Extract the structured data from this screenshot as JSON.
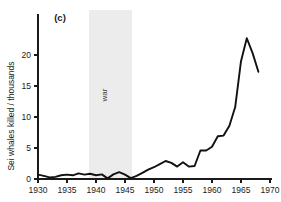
{
  "figure": {
    "panel_label": "(c)",
    "background_color": "#ffffff",
    "line_color": "#111111",
    "band_color": "#ececed"
  },
  "chart_data": {
    "type": "line",
    "title": "",
    "subtitle": "",
    "panel": "(c)",
    "xlabel": "",
    "ylabel": "Sei whales killed / thousands",
    "xlim": [
      1930,
      1970
    ],
    "ylim": [
      0,
      24
    ],
    "xticks": [
      1930,
      1935,
      1940,
      1945,
      1950,
      1955,
      1960,
      1965,
      1970
    ],
    "xtick_labels": [
      "1930",
      "1935",
      "1940",
      "1945",
      "1950",
      "1955",
      "1960",
      "1965",
      "1970"
    ],
    "yticks": [
      0,
      5,
      10,
      15,
      20
    ],
    "ytick_labels": [
      "0",
      "5",
      "10",
      "15",
      "20"
    ],
    "grid": false,
    "legend": null,
    "annotations": [
      {
        "text": "war",
        "type": "shaded-band",
        "orientation": "vertical",
        "x_start": 1938.8,
        "x_end": 1946.2,
        "color": "#ececed"
      }
    ],
    "x": [
      1930,
      1931,
      1932,
      1933,
      1934,
      1935,
      1936,
      1937,
      1938,
      1939,
      1940,
      1941,
      1942,
      1943,
      1944,
      1945,
      1946,
      1947,
      1948,
      1949,
      1950,
      1951,
      1952,
      1953,
      1954,
      1955,
      1956,
      1957,
      1958,
      1959,
      1960,
      1961,
      1962,
      1963,
      1964,
      1965,
      1966,
      1967,
      1968
    ],
    "values": [
      0.7,
      0.5,
      0.25,
      0.35,
      0.6,
      0.7,
      0.6,
      0.9,
      0.7,
      0.85,
      0.6,
      0.75,
      0.1,
      0.75,
      1.1,
      0.7,
      0.15,
      0.5,
      1.0,
      1.5,
      1.9,
      2.4,
      2.9,
      2.6,
      2.0,
      2.7,
      2.0,
      2.1,
      4.6,
      4.6,
      5.2,
      6.9,
      7.0,
      8.6,
      11.6,
      19.0,
      22.7,
      20.3,
      17.3
    ],
    "series": [
      {
        "name": "Sei whales killed",
        "values": [
          0.7,
          0.5,
          0.25,
          0.35,
          0.6,
          0.7,
          0.6,
          0.9,
          0.7,
          0.85,
          0.6,
          0.75,
          0.1,
          0.75,
          1.1,
          0.7,
          0.15,
          0.5,
          1.0,
          1.5,
          1.9,
          2.4,
          2.9,
          2.6,
          2.0,
          2.7,
          2.0,
          2.1,
          4.6,
          4.6,
          5.2,
          6.9,
          7.0,
          8.6,
          11.6,
          19.0,
          22.7,
          20.3,
          17.3
        ]
      }
    ]
  }
}
